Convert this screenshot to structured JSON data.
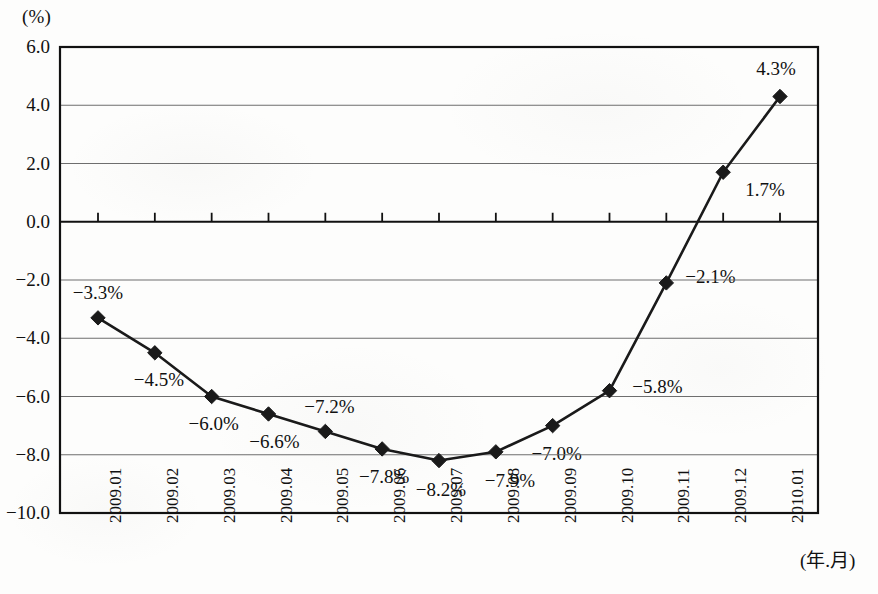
{
  "chart_data": {
    "type": "line",
    "title": "",
    "subtitle": "",
    "unit_label": "(%)",
    "xlabel": "(年.月)",
    "ylabel": "",
    "categories": [
      "2009.01",
      "2009.02",
      "2009.03",
      "2009.04",
      "2009.05",
      "2009.06",
      "2009.07",
      "2009.08",
      "2009.09",
      "2009.10",
      "2009.11",
      "2009.12",
      "2010.01"
    ],
    "values": [
      -3.3,
      -4.5,
      -6.0,
      -6.6,
      -7.2,
      -7.8,
      -8.2,
      -7.9,
      -7.0,
      -5.8,
      -2.1,
      1.7,
      4.3
    ],
    "point_labels": [
      "−3.3%",
      "−4.5%",
      "−6.0%",
      "−6.6%",
      "−7.2%",
      "−7.8%",
      "−8.2%",
      "−7.9%",
      "−7.0%",
      "−5.8%",
      "−2.1%",
      "1.7%",
      "4.3%"
    ],
    "ylim": [
      -10.0,
      6.0
    ],
    "ytick_values": [
      6.0,
      4.0,
      2.0,
      0.0,
      -2.0,
      -4.0,
      -6.0,
      -8.0,
      -10.0
    ],
    "ytick_labels": [
      "6.0",
      "4.0",
      "2.0",
      "0.0",
      "−2.0",
      "−4.0",
      "−6.0",
      "−8.0",
      "−10.0"
    ],
    "grid": true,
    "legend": null,
    "marker": "diamond",
    "line_color": "#1a1a1a",
    "grid_color": "#6e6e6e",
    "axis_color": "#111111"
  },
  "label_offsets": [
    {
      "dx": 0,
      "dy": -25
    },
    {
      "dx": 4,
      "dy": 27
    },
    {
      "dx": 2,
      "dy": 27
    },
    {
      "dx": 6,
      "dy": 28
    },
    {
      "dx": 4,
      "dy": -24
    },
    {
      "dx": 2,
      "dy": 28
    },
    {
      "dx": 2,
      "dy": 29
    },
    {
      "dx": 14,
      "dy": 29
    },
    {
      "dx": 4,
      "dy": 28
    },
    {
      "dx": 48,
      "dy": -4
    },
    {
      "dx": 44,
      "dy": -6
    },
    {
      "dx": 42,
      "dy": 18
    },
    {
      "dx": -4,
      "dy": -28
    }
  ]
}
